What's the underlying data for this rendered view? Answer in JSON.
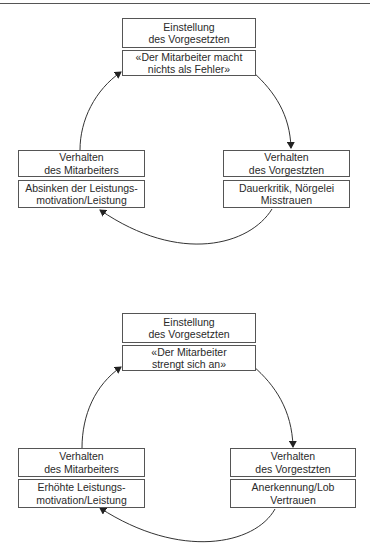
{
  "diagrams": [
    {
      "name": "negative-cycle",
      "top": {
        "title": [
          "Einstellung",
          "des Vorgesetzten"
        ],
        "detail": [
          "«Der Mitarbeiter macht",
          "nichts als Fehler»"
        ]
      },
      "right": {
        "title": [
          "Verhalten",
          "des Vorgestzten"
        ],
        "detail": [
          "Dauerkritik, Nörgelei",
          "Misstrauen"
        ]
      },
      "left": {
        "title": [
          "Verhalten",
          "des Mitarbeiters"
        ],
        "detail": [
          "Absinken der Leistungs-",
          "motivation/Leistung"
        ]
      }
    },
    {
      "name": "positive-cycle",
      "top": {
        "title": [
          "Einstellung",
          "des Vorgesetzten"
        ],
        "detail": [
          "«Der Mitarbeiter",
          "strengt sich an»"
        ]
      },
      "right": {
        "title": [
          "Verhalten",
          "des Vorgestzten"
        ],
        "detail": [
          "Anerkennung/Lob",
          "Vertrauen"
        ]
      },
      "left": {
        "title": [
          "Verhalten",
          "des Mitarbeiters"
        ],
        "detail": [
          "Erhöhte Leistungs-",
          "motivation/Leistung"
        ]
      }
    }
  ],
  "colors": {
    "line": "#333333",
    "border": "#555555",
    "text": "#2a2a2a"
  }
}
